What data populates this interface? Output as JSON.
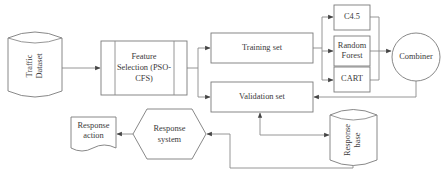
{
  "diagram": {
    "type": "flowchart",
    "nodes": {
      "traffic_dataset": {
        "label_line1": "Traffic",
        "label_line2": "Dataset",
        "shape": "cylinder",
        "orientation": "vertical-text"
      },
      "feature_selection": {
        "label_line1": "Feature",
        "label_line2": "Selection (PSO-",
        "label_line3": "CFS)",
        "shape": "predefined-process"
      },
      "training_set": {
        "label": "Training set",
        "shape": "rectangle"
      },
      "validation_set": {
        "label": "Validation set",
        "shape": "rectangle"
      },
      "c45": {
        "label": "C4.5",
        "shape": "rectangle"
      },
      "random_forest": {
        "label_line1": "Random",
        "label_line2": "Forest",
        "shape": "rectangle"
      },
      "cart": {
        "label": "CART",
        "shape": "rectangle"
      },
      "combiner": {
        "label": "Combiner",
        "shape": "circle"
      },
      "response_base": {
        "label_line1": "Response",
        "label_line2": "base",
        "shape": "cylinder",
        "orientation": "vertical-text"
      },
      "response_system": {
        "label_line1": "Response",
        "label_line2": "system",
        "shape": "hexagon"
      },
      "response_action": {
        "label_line1": "Response",
        "label_line2": "action",
        "shape": "document"
      }
    },
    "edges": [
      {
        "from": "Traffic Dataset",
        "to": "Feature Selection (PSO-CFS)"
      },
      {
        "from": "Feature Selection (PSO-CFS)",
        "to": "Training set"
      },
      {
        "from": "Feature Selection (PSO-CFS)",
        "to": "Validation set"
      },
      {
        "from": "Training set",
        "to": "C4.5"
      },
      {
        "from": "Training set",
        "to": "Random Forest"
      },
      {
        "from": "Training set",
        "to": "CART"
      },
      {
        "from": "C4.5",
        "to": "Combiner"
      },
      {
        "from": "Random Forest",
        "to": "Combiner"
      },
      {
        "from": "CART",
        "to": "Combiner"
      },
      {
        "from": "Combiner",
        "to": "Validation set"
      },
      {
        "from": "Validation set",
        "to": "Response base",
        "bidirectional": true
      },
      {
        "from": "Response base",
        "to": "Response system"
      },
      {
        "from": "Response system",
        "to": "Response action"
      }
    ]
  }
}
